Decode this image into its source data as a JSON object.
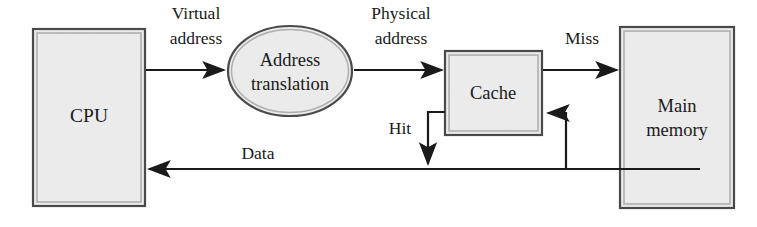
{
  "diagram": {
    "canvas": {
      "width": 757,
      "height": 227
    },
    "style": {
      "background_color": "#ffffff",
      "node_fill_color": "#ebebeb",
      "node_outer_border_color": "#4a4a4a",
      "node_inner_border_color": "#a8a8a8",
      "edge_color": "#1a1a1a",
      "text_color": "#1a1a1a"
    },
    "nodes": [
      {
        "id": "cpu",
        "shape": "rectangle",
        "label": "CPU",
        "label_lines": [
          "CPU"
        ],
        "x": 33,
        "y": 29,
        "width": 112,
        "height": 177
      },
      {
        "id": "address-translation",
        "shape": "ellipse",
        "label": "Address translation",
        "label_lines": [
          "Address",
          "translation"
        ],
        "cx": 290,
        "cy": 71,
        "rx": 62,
        "ry": 45
      },
      {
        "id": "cache",
        "shape": "rectangle",
        "label": "Cache",
        "label_lines": [
          "Cache"
        ],
        "x": 445,
        "y": 51,
        "width": 97,
        "height": 84
      },
      {
        "id": "main-memory",
        "shape": "rectangle",
        "label": "Main memory",
        "label_lines": [
          "Main",
          "memory"
        ],
        "x": 620,
        "y": 27,
        "width": 114,
        "height": 181
      }
    ],
    "edges": [
      {
        "id": "virtual-address",
        "label": "Virtual address",
        "label_lines": [
          "Virtual",
          "address"
        ],
        "from": "cpu",
        "to": "address-translation",
        "direction": "right"
      },
      {
        "id": "physical-address",
        "label": "Physical address",
        "label_lines": [
          "Physical",
          "address"
        ],
        "from": "address-translation",
        "to": "cache",
        "direction": "right"
      },
      {
        "id": "miss",
        "label": "Miss",
        "label_lines": [
          "Miss"
        ],
        "from": "cache",
        "to": "main-memory",
        "direction": "right"
      },
      {
        "id": "hit",
        "label": "Hit",
        "label_lines": [
          "Hit"
        ],
        "from": "cache",
        "to": "data-bus",
        "direction": "down"
      },
      {
        "id": "data",
        "label": "Data",
        "label_lines": [
          "Data"
        ],
        "from": "main-memory",
        "to": "cpu",
        "direction": "left"
      },
      {
        "id": "memory-to-cache-fill",
        "label": "",
        "label_lines": [],
        "from": "main-memory",
        "to": "cache",
        "direction": "left"
      }
    ],
    "labels": {
      "cpu": "CPU",
      "address_translation_line1": "Address",
      "address_translation_line2": "translation",
      "cache": "Cache",
      "main_memory_line1": "Main",
      "main_memory_line2": "memory",
      "virtual_address_line1": "Virtual",
      "virtual_address_line2": "address",
      "physical_address_line1": "Physical",
      "physical_address_line2": "address",
      "miss": "Miss",
      "hit": "Hit",
      "data": "Data"
    }
  }
}
